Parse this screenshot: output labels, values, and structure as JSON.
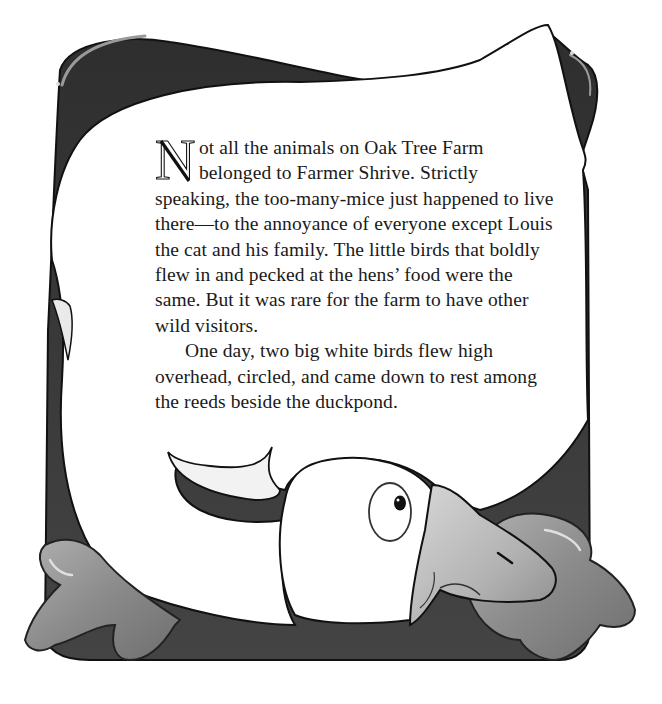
{
  "story": {
    "drop_cap": "N",
    "lines": [
      "ot all the animals on Oak Tree Farm",
      "belonged to Farmer Shrive. Strictly",
      "speaking, the too-many-mice just happened to live",
      "there—to the annoyance of everyone except Louis",
      "the cat and his family. The little birds that boldly",
      "flew in and pecked at the hens’ food were the",
      "same. But it was rare for the farm to have other",
      "wild visitors.",
      "One day, two big white birds flew high",
      "overhead, circled, and came down to rest among",
      "the reeds beside the duckpond."
    ]
  },
  "illustration": {
    "subject": "white goose curled around the text",
    "colors": {
      "body": "#ffffff",
      "outline": "#111111",
      "dark_fill": "#3a3a3a",
      "feet": "#8a8a8a",
      "beak": "#b5b5b5"
    }
  }
}
